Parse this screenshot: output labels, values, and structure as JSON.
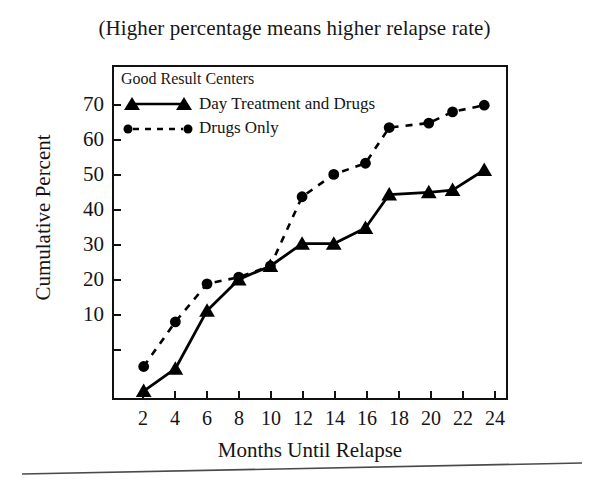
{
  "chart_data": {
    "type": "line",
    "title": "(Higher percentage means higher relapse rate)",
    "subtitle": "",
    "xlabel": "Months Until Relapse",
    "ylabel": "Cumulative Percent",
    "xlim": [
      0,
      25
    ],
    "ylim": [
      0,
      75
    ],
    "xticks": [
      2,
      4,
      6,
      8,
      10,
      12,
      14,
      16,
      18,
      20,
      22,
      24
    ],
    "yticks": [
      10,
      20,
      30,
      40,
      50,
      60,
      70
    ],
    "grid": false,
    "legend_position": "top-left",
    "legend_title": "Good Result Centers",
    "series": [
      {
        "name": "Day Treatment and Drugs",
        "marker": "triangle",
        "linestyle": "solid",
        "color": "#000000",
        "x": [
          2,
          4,
          6,
          8,
          10,
          12,
          14,
          16,
          17.5,
          20,
          21.5,
          23.5
        ],
        "values": [
          2,
          7,
          20,
          27,
          30,
          35,
          35,
          38.5,
          46,
          46.5,
          47,
          51.5
        ]
      },
      {
        "name": "Drugs Only",
        "marker": "circle",
        "linestyle": "dashed",
        "color": "#000000",
        "x": [
          2,
          4,
          6,
          8,
          10,
          12,
          14,
          16,
          17.5,
          20,
          21.5,
          23.5
        ],
        "values": [
          7.5,
          17.5,
          26,
          27.5,
          30,
          45.5,
          50.5,
          53,
          61,
          62,
          64.5,
          66
        ]
      }
    ]
  },
  "legend": {
    "title": "Good Result Centers",
    "entries": [
      {
        "label": "Day Treatment and Drugs",
        "marker": "triangle",
        "linestyle": "solid"
      },
      {
        "label": "Drugs Only",
        "marker": "circle",
        "linestyle": "dashed"
      }
    ]
  },
  "axes": {
    "y_title": "Cumulative Percent",
    "x_title": "Months Until Relapse",
    "y_ticks": [
      "70",
      "60",
      "50",
      "40",
      "30",
      "20",
      "10"
    ],
    "x_ticks": [
      "2",
      "4",
      "6",
      "8",
      "10",
      "12",
      "14",
      "16",
      "18",
      "20",
      "22",
      "24"
    ]
  },
  "title": "(Higher percentage means higher relapse rate)"
}
